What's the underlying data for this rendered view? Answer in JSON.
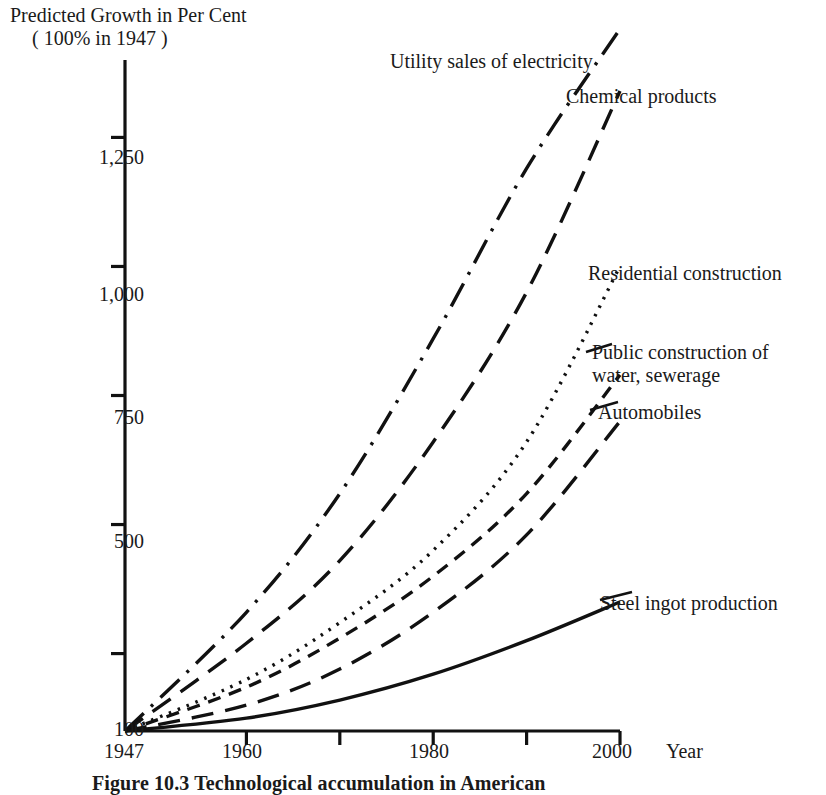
{
  "figure": {
    "axis_title_line1": "Predicted Growth in Per Cent",
    "axis_title_line2": "( 100% in 1947 )",
    "caption": "Figure 10.3 Technological accumulation in American",
    "xaxis_name": "Year"
  },
  "chart_data": {
    "type": "line",
    "title": "Predicted Growth in Per Cent ( 100% in 1947 )",
    "xlabel": "Year",
    "ylabel": "Predicted Growth in Per Cent ( 100% in 1947 )",
    "xlim": [
      1947,
      2000
    ],
    "ylim": [
      100,
      1400
    ],
    "grid": false,
    "legend": "inline-right-annotations",
    "baseline_note": "All series indexed to 100 in 1947",
    "xticks": [
      1947,
      1960,
      1970,
      1980,
      1990,
      2000
    ],
    "xticklabels": [
      "1947",
      "1960",
      "",
      "1980",
      "",
      "2000"
    ],
    "yticks": [
      100,
      250,
      500,
      750,
      1000,
      1250
    ],
    "yticklabels": [
      "100",
      "",
      "500",
      "750",
      "1,000",
      "1,250"
    ],
    "x": [
      1947,
      1960,
      1970,
      1980,
      1990,
      2000
    ],
    "series": [
      {
        "name": "Utility sales of electricity",
        "linestyle": "dashdot",
        "color": "#111111",
        "values": [
          100,
          330,
          560,
          860,
          1190,
          1460
        ],
        "label_x": 1978,
        "label_y": 1420
      },
      {
        "name": "Chemical products",
        "linestyle": "longdash",
        "color": "#111111",
        "values": [
          100,
          270,
          430,
          660,
          950,
          1340
        ],
        "label_x": 1990,
        "label_y": 1330
      },
      {
        "name": "Residential construction",
        "linestyle": "dotted",
        "color": "#111111",
        "values": [
          100,
          200,
          310,
          450,
          660,
          1000
        ],
        "label_x": 1988,
        "label_y": 1060
      },
      {
        "name": "Public construction of water, sewerage",
        "linestyle": "dash",
        "color": "#111111",
        "values": [
          100,
          185,
          280,
          400,
          560,
          790
        ],
        "label_x": 1995,
        "label_y": 870
      },
      {
        "name": "Automobiles",
        "linestyle": "longdash",
        "color": "#111111",
        "values": [
          100,
          150,
          220,
          330,
          480,
          700
        ],
        "label_x": 1995,
        "label_y": 740
      },
      {
        "name": "Steel ingot production",
        "linestyle": "solid",
        "color": "#111111",
        "values": [
          100,
          125,
          160,
          210,
          275,
          350
        ],
        "label_x": 1993,
        "label_y": 385
      }
    ]
  }
}
